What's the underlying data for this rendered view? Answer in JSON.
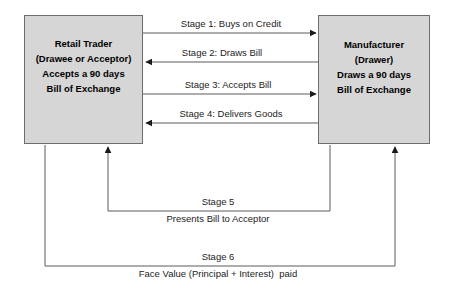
{
  "diagram": {
    "colors": {
      "box_fill": "#d6d6d6",
      "box_border": "#6d6d6d",
      "line": "#5a5a5a",
      "text": "#000000"
    },
    "entities": [
      {
        "id": "retail-trader",
        "lines": [
          "Retail Trader",
          "(Drawee or Acceptor)",
          "Accepts a 90 days",
          "Bill of Exchange"
        ]
      },
      {
        "id": "manufacturer",
        "lines": [
          "Manufacturer",
          "(Drawer)",
          "Draws a 90 days",
          "Bill of Exchange"
        ]
      }
    ],
    "flows": [
      {
        "id": "stage-1",
        "label": "Stage 1: Buys on Credit",
        "direction": "left-to-right"
      },
      {
        "id": "stage-2",
        "label": "Stage 2: Draws Bill",
        "direction": "right-to-left"
      },
      {
        "id": "stage-3",
        "label": "Stage 3: Accepts Bill",
        "direction": "left-to-right"
      },
      {
        "id": "stage-4",
        "label": "Stage 4: Delivers Goods",
        "direction": "right-to-left"
      },
      {
        "id": "stage-5",
        "label": "Stage 5",
        "sublabel": "Presents Bill to Acceptor",
        "direction": "right-to-left"
      },
      {
        "id": "stage-6",
        "label": "Stage 6",
        "sublabel": "Face Value (Principal + Interest)  paid",
        "direction": "left-to-right"
      }
    ]
  }
}
